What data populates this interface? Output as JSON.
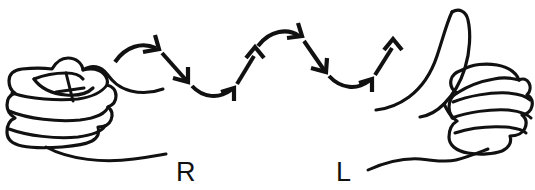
{
  "figure": {
    "background_color": "#ffffff",
    "ink_color": "#111111",
    "width": 535,
    "height": 190
  },
  "hands": {
    "left": {
      "label": "R",
      "label_meaning": "right hand",
      "shape": "closed-fist",
      "finger_rows": 4,
      "thumb": "folded-over-top",
      "label_x": 176,
      "label_y": 181
    },
    "right": {
      "label": "L",
      "label_meaning": "left hand",
      "shape": "fist-with-extended-thumb",
      "finger_rows": 4,
      "thumb": "extended-up-left",
      "label_x": 336,
      "label_y": 181
    }
  },
  "motion_path": {
    "description": "wavy arrow chain travelling left to right",
    "direction": "left-to-right",
    "segment_count": 6,
    "pattern": "up-down-up-down-up",
    "segments": [
      {
        "index": 1,
        "kind": "curve",
        "heading": "up-right"
      },
      {
        "index": 2,
        "kind": "straight",
        "heading": "down-right"
      },
      {
        "index": 3,
        "kind": "curve",
        "heading": "down-right-then-up"
      },
      {
        "index": 4,
        "kind": "straight",
        "heading": "up-right"
      },
      {
        "index": 5,
        "kind": "curve",
        "heading": "up-right-over-crest"
      },
      {
        "index": 6,
        "kind": "straight",
        "heading": "down-right"
      },
      {
        "index": 7,
        "kind": "curve",
        "heading": "down-right-then-up"
      },
      {
        "index": 8,
        "kind": "straight",
        "heading": "up-right"
      }
    ]
  }
}
